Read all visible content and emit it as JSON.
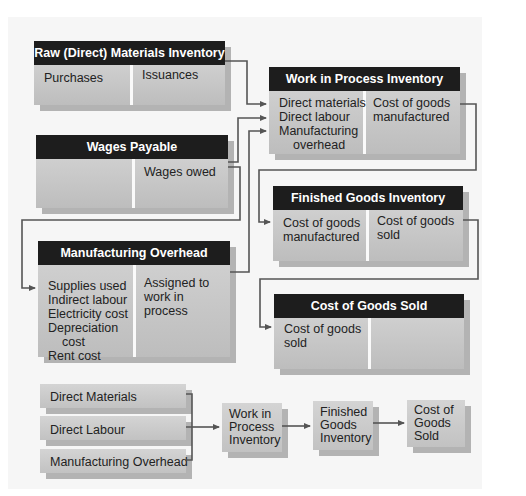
{
  "accounts": {
    "raw_materials": {
      "title": "Raw (Direct) Materials Inventory",
      "debit": [
        "Purchases"
      ],
      "credit": [
        "Issuances"
      ]
    },
    "wages_payable": {
      "title": "Wages Payable",
      "debit": [],
      "credit": [
        "Wages owed"
      ]
    },
    "work_in_process": {
      "title": "Work in Process Inventory",
      "debit": [
        "Direct materials",
        "Direct labour",
        "Manufacturing",
        "overhead"
      ],
      "credit": [
        "Cost of goods",
        "manufactured"
      ]
    },
    "finished_goods": {
      "title": "Finished Goods Inventory",
      "debit": [
        "Cost of goods",
        "manufactured"
      ],
      "credit": [
        "Cost of goods",
        "sold"
      ]
    },
    "manufacturing_overhead": {
      "title": "Manufacturing Overhead",
      "debit": [
        "Supplies used",
        "Indirect labour",
        "Electricity cost",
        "Depreciation",
        "cost",
        "Rent cost"
      ],
      "credit": [
        "Assigned to",
        "work in",
        "process"
      ]
    },
    "cost_of_goods_sold": {
      "title": "Cost of Goods Sold",
      "debit": [
        "Cost of goods",
        "sold"
      ],
      "credit": []
    }
  },
  "summary_flow": {
    "inputs": [
      "Direct Materials",
      "Direct Labour",
      "Manufacturing Overhead"
    ],
    "stages": [
      [
        "Work in",
        "Process",
        "Inventory"
      ],
      [
        "Finished",
        "Goods",
        "Inventory"
      ],
      [
        "Cost of",
        "Goods",
        "Sold"
      ]
    ]
  },
  "colors": {
    "header": "#1d1d1d",
    "box": "#c8c8c8",
    "shadow": "#b3b3b3",
    "line": "#555555"
  }
}
